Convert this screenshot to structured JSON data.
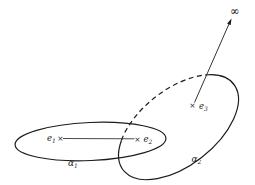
{
  "figure": {
    "type": "math-diagram-riemann-cycles",
    "background_color": "#ffffff",
    "ink_color": "#1c1c1c",
    "labels": {
      "e1": {
        "main": "e",
        "sub": "1"
      },
      "e2": {
        "main": "e",
        "sub": "2"
      },
      "e3": {
        "main": "e",
        "sub": "3"
      },
      "alpha1": {
        "main": "α",
        "sub": "1"
      },
      "alpha2": {
        "main": "α",
        "sub": "2"
      },
      "infinity": "∞"
    },
    "markers": {
      "point_symbol": "×"
    },
    "curves": [
      {
        "id": "alpha1",
        "style": "solid ellipse",
        "encloses": "e1, e2"
      },
      {
        "id": "alpha2",
        "style": "ellipse, dashed on upper-left arc",
        "encloses": "e3"
      }
    ],
    "branch_cuts": [
      {
        "from": "e1",
        "to": "e2",
        "style": "segment between crosses"
      },
      {
        "from": "e3",
        "to": "∞",
        "style": "arrow toward infinity"
      }
    ]
  }
}
